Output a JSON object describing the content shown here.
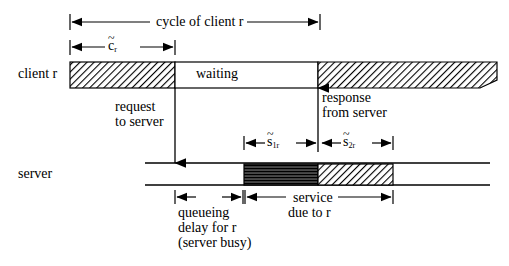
{
  "figure": {
    "type": "timing-diagram"
  },
  "axis_labels": {
    "client": "client r",
    "server": "server"
  },
  "client_bar": {
    "segments": [
      {
        "name": "compute-before-request",
        "fill": "diagonal-hatch",
        "x0": 70,
        "x1": 175
      },
      {
        "name": "waiting",
        "label": "waiting",
        "fill": "white",
        "x0": 175,
        "x1": 318
      },
      {
        "name": "compute-after-response",
        "fill": "diagonal-hatch",
        "x0": 318,
        "x1": 497
      }
    ]
  },
  "server_bar": {
    "line_x0": 145,
    "line_x1": 490,
    "segments": [
      {
        "name": "service-part-1",
        "fill": "horizontal-lines",
        "x0": 244,
        "x1": 318
      },
      {
        "name": "service-part-2",
        "fill": "diagonal-hatch",
        "x0": 318,
        "x1": 393
      }
    ]
  },
  "measures": [
    {
      "name": "cycle-of-client-r",
      "label": "cycle of client r",
      "x0": 70,
      "x1": 320,
      "y": 22
    },
    {
      "name": "c-tilde-r",
      "base": "c",
      "sub": "r",
      "accent": "tilde",
      "x0": 70,
      "x1": 175,
      "y": 47
    },
    {
      "name": "s-tilde-1r",
      "base": "s",
      "sub": "1r",
      "accent": "tilde",
      "x0": 244,
      "x1": 318,
      "y": 143
    },
    {
      "name": "s-tilde-2r",
      "base": "s",
      "sub": "2r",
      "accent": "tilde",
      "x0": 320,
      "x1": 393,
      "y": 143
    },
    {
      "name": "queueing-delay",
      "label": "queueing",
      "x0": 175,
      "x1": 243,
      "y": 197
    },
    {
      "name": "service-due-to-r",
      "label": "service",
      "x0": 245,
      "x1": 393,
      "y": 197
    }
  ],
  "annotations": {
    "request": {
      "line1": "request",
      "line2": "to server",
      "arrow_x": 175,
      "arrow_from_y": 88,
      "arrow_to_y": 163
    },
    "response": {
      "line1": "response",
      "line2": "from server",
      "arrow_x": 318,
      "arrow_from_y": 152,
      "arrow_to_y": 88
    },
    "queueing": {
      "line1": "queueing",
      "line2": "delay for r",
      "line3": "(server busy)"
    },
    "service": {
      "line1": "service",
      "line2": "due to r"
    }
  },
  "colors": {
    "stroke": "#000000",
    "background": "#ffffff",
    "hatch": "#1a1a1a",
    "dense_fill": "#3a3a3a"
  }
}
